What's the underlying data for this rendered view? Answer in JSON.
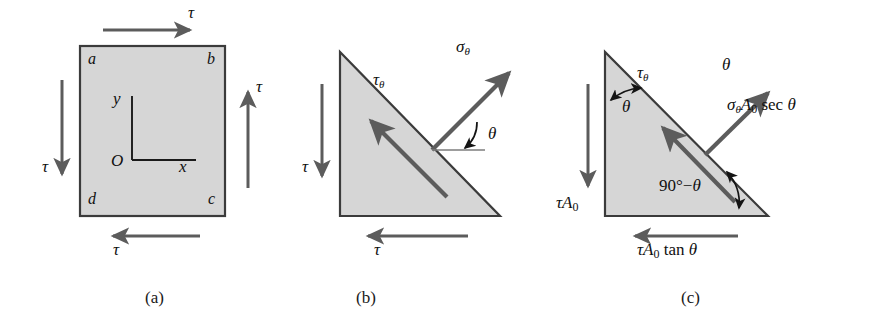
{
  "figure": {
    "type": "mechanics-stress-diagram",
    "background": "#ffffff",
    "fill_color": "#d6d6d6",
    "outline_color": "#3b3b3b",
    "arrow_color": "#5c5c5c",
    "thin_arrow_color": "#1a1a1a",
    "captions": [
      {
        "id": "a",
        "text": "(a)",
        "x": 145,
        "y": 288
      },
      {
        "id": "b",
        "text": "(b)",
        "x": 356,
        "y": 288
      },
      {
        "id": "c",
        "text": "(c)",
        "x": 681,
        "y": 288
      }
    ]
  },
  "panel_a": {
    "name": "pure-shear-element",
    "square": {
      "x": 80,
      "y": 46,
      "w": 145,
      "h": 170
    },
    "corner_labels": [
      {
        "id": "a",
        "text": "a",
        "x": 88,
        "y": 56
      },
      {
        "id": "b",
        "text": "b",
        "x": 209,
        "y": 56
      },
      {
        "id": "d",
        "text": "d",
        "x": 88,
        "y": 191
      },
      {
        "id": "c",
        "text": "c",
        "x": 209,
        "y": 191
      }
    ],
    "axes": {
      "origin_label": "O",
      "y_label": "y",
      "x_label": "x",
      "origin_x": 132,
      "origin_y": 160
    },
    "shear_labels": {
      "top": "τ",
      "right": "τ",
      "bottom": "τ",
      "left": "τ"
    }
  },
  "panel_b": {
    "name": "wedge-stress-element",
    "triangle": {
      "apex_x": 340,
      "apex_y": 52,
      "bl_x": 340,
      "bl_y": 216,
      "br_x": 500,
      "br_y": 216
    },
    "labels": {
      "sigma_theta": {
        "base": "σ",
        "sub": "θ"
      },
      "tau_theta": {
        "base": "τ",
        "sub": "θ"
      },
      "angle_theta": "θ",
      "tau_left": "τ",
      "tau_bottom": "τ"
    }
  },
  "panel_c": {
    "name": "wedge-free-body-diagram",
    "triangle": {
      "apex_x": 605,
      "apex_y": 52,
      "bl_x": 605,
      "bl_y": 216,
      "br_x": 768,
      "br_y": 216
    },
    "labels": {
      "tau_theta": {
        "base": "τ",
        "sub": "θ"
      },
      "apex_angle": "θ",
      "top_angle": "θ",
      "sigma_force": {
        "sigma": "σ",
        "sigma_sub": "θ",
        "area": "A",
        "area_sub": "0",
        "fn": "sec",
        "angle": "θ"
      },
      "base_angle": {
        "text": "90°−",
        "angle": "θ"
      },
      "tau_a0": {
        "base": "τ",
        "area": "A",
        "area_sub": "0"
      },
      "tau_a0_tan": {
        "base": "τ",
        "area": "A",
        "area_sub": "0",
        "fn": "tan",
        "angle": "θ"
      }
    }
  }
}
